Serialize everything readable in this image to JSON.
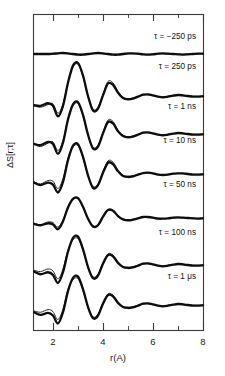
{
  "figure": {
    "axis_label_x": "r(A)",
    "axis_label_y": "ΔS[r;τ]",
    "frame": {
      "left": 33,
      "right": 203,
      "top": 14,
      "bottom": 330
    }
  },
  "chart_data": {
    "type": "line",
    "title": "",
    "xlabel": "r(A)",
    "ylabel": "ΔS[r;τ]",
    "xlim": [
      1.2,
      8.0
    ],
    "ylim": [
      -1.0,
      1.0
    ],
    "grid": false,
    "legend_position": "inline-right",
    "xticks_major": [
      2,
      4,
      6,
      8
    ],
    "xticks_minor": [
      3,
      5,
      7
    ],
    "xtick_labels": [
      "2",
      "4",
      "6",
      "8"
    ],
    "yticks": [],
    "note": "Seven vertically offset radial difference-scattering traces, each an experimental curve overlaid with a model fit, labelled by time delay tau.",
    "series": [
      {
        "name": "τ = −250 ps",
        "label": "τ = −250 ps",
        "baseline_y_px": 54,
        "label_x_px": 196,
        "label_y_px": 32,
        "amplitude": 0.04,
        "x": [
          1.25,
          1.5,
          1.8,
          2.0,
          2.2,
          2.4,
          2.6,
          2.8,
          3.0,
          3.2,
          3.4,
          3.6,
          3.8,
          4.0,
          4.2,
          4.4,
          4.6,
          4.8,
          5.0,
          5.2,
          5.4,
          5.6,
          5.8,
          6.0,
          6.2,
          6.4,
          6.6,
          6.8,
          7.0,
          7.2,
          7.4,
          7.6,
          7.8,
          8.0
        ],
        "values": [
          0.0,
          0.0,
          0.0,
          0.01,
          0.02,
          0.03,
          0.02,
          0.0,
          -0.02,
          -0.02,
          0.0,
          0.02,
          0.03,
          0.02,
          0.0,
          -0.02,
          -0.02,
          0.0,
          0.02,
          0.02,
          0.01,
          -0.01,
          -0.02,
          -0.01,
          0.01,
          0.02,
          0.01,
          0.0,
          -0.01,
          -0.02,
          -0.01,
          0.0,
          0.01,
          0.01
        ],
        "fit": [
          0.0,
          0.0,
          0.0,
          0.0,
          0.01,
          0.02,
          0.01,
          0.0,
          -0.01,
          -0.01,
          0.0,
          0.01,
          0.02,
          0.01,
          0.0,
          -0.01,
          -0.01,
          0.0,
          0.01,
          0.01,
          0.0,
          -0.01,
          -0.01,
          0.0,
          0.01,
          0.01,
          0.0,
          0.0,
          -0.01,
          -0.01,
          0.0,
          0.0,
          0.01,
          0.0
        ]
      },
      {
        "name": "τ = 250 ps",
        "label": "τ = 250 ps",
        "baseline_y_px": 96,
        "label_x_px": 196,
        "label_y_px": 62,
        "amplitude": 1.0,
        "x": [
          1.25,
          1.5,
          1.8,
          2.0,
          2.2,
          2.4,
          2.6,
          2.8,
          3.0,
          3.2,
          3.4,
          3.6,
          3.8,
          4.0,
          4.2,
          4.4,
          4.6,
          4.8,
          5.0,
          5.2,
          5.4,
          5.6,
          5.8,
          6.0,
          6.2,
          6.4,
          6.6,
          6.8,
          7.0,
          7.2,
          7.4,
          7.6,
          7.8,
          8.0
        ],
        "values": [
          -0.28,
          -0.3,
          -0.22,
          -0.3,
          -0.62,
          -0.3,
          0.4,
          0.92,
          1.0,
          0.62,
          0.0,
          -0.44,
          -0.38,
          0.02,
          0.38,
          0.34,
          0.1,
          -0.06,
          -0.1,
          -0.08,
          -0.02,
          0.04,
          0.05,
          0.02,
          -0.02,
          -0.04,
          -0.02,
          0.01,
          0.03,
          0.02,
          0.0,
          -0.02,
          -0.02,
          -0.01
        ],
        "fit": [
          -0.3,
          -0.34,
          -0.26,
          -0.24,
          -0.52,
          -0.24,
          0.42,
          0.88,
          0.96,
          0.58,
          -0.02,
          -0.4,
          -0.34,
          0.06,
          0.44,
          0.4,
          0.14,
          -0.04,
          -0.08,
          -0.06,
          -0.01,
          0.03,
          0.04,
          0.01,
          -0.02,
          -0.03,
          -0.01,
          0.01,
          0.02,
          0.01,
          0.0,
          -0.01,
          -0.01,
          0.0
        ]
      },
      {
        "name": "τ = 1 ns",
        "label": "τ = 1 ns",
        "baseline_y_px": 134,
        "label_x_px": 196,
        "label_y_px": 102,
        "amplitude": 0.95,
        "x": [
          1.25,
          1.5,
          1.8,
          2.0,
          2.2,
          2.4,
          2.6,
          2.8,
          3.0,
          3.2,
          3.4,
          3.6,
          3.8,
          4.0,
          4.2,
          4.4,
          4.6,
          4.8,
          5.0,
          5.2,
          5.4,
          5.6,
          5.8,
          6.0,
          6.2,
          6.4,
          6.6,
          6.8,
          7.0,
          7.2,
          7.4,
          7.6,
          7.8,
          8.0
        ],
        "values": [
          -0.3,
          -0.34,
          -0.24,
          -0.3,
          -0.6,
          -0.26,
          0.44,
          0.9,
          0.96,
          0.58,
          -0.02,
          -0.44,
          -0.38,
          0.02,
          0.36,
          0.32,
          0.08,
          -0.06,
          -0.1,
          -0.08,
          -0.02,
          0.04,
          0.05,
          0.02,
          -0.02,
          -0.04,
          -0.02,
          0.01,
          0.03,
          0.02,
          0.0,
          -0.02,
          -0.02,
          -0.01
        ],
        "fit": [
          -0.32,
          -0.38,
          -0.28,
          -0.24,
          -0.5,
          -0.2,
          0.46,
          0.86,
          0.92,
          0.54,
          -0.04,
          -0.4,
          -0.34,
          0.06,
          0.42,
          0.38,
          0.12,
          -0.04,
          -0.08,
          -0.06,
          -0.01,
          0.03,
          0.04,
          0.01,
          -0.02,
          -0.03,
          -0.01,
          0.01,
          0.02,
          0.01,
          0.0,
          -0.01,
          -0.01,
          0.0
        ]
      },
      {
        "name": "τ = 10 ns",
        "label": "τ = 10 ns",
        "baseline_y_px": 174,
        "label_x_px": 196,
        "label_y_px": 136,
        "amplitude": 0.9,
        "x": [
          1.25,
          1.5,
          1.8,
          2.0,
          2.2,
          2.4,
          2.6,
          2.8,
          3.0,
          3.2,
          3.4,
          3.6,
          3.8,
          4.0,
          4.2,
          4.4,
          4.6,
          4.8,
          5.0,
          5.2,
          5.4,
          5.6,
          5.8,
          6.0,
          6.2,
          6.4,
          6.6,
          6.8,
          7.0,
          7.2,
          7.4,
          7.6,
          7.8,
          8.0
        ],
        "values": [
          -0.26,
          -0.34,
          -0.26,
          -0.32,
          -0.56,
          -0.24,
          0.42,
          0.86,
          0.9,
          0.52,
          -0.04,
          -0.42,
          -0.34,
          0.04,
          0.34,
          0.3,
          0.08,
          -0.06,
          -0.09,
          -0.07,
          -0.02,
          0.03,
          0.04,
          0.02,
          -0.02,
          -0.03,
          -0.02,
          0.01,
          0.02,
          0.02,
          0.0,
          -0.02,
          -0.02,
          -0.01
        ],
        "fit": [
          -0.24,
          -0.3,
          -0.2,
          -0.22,
          -0.44,
          -0.14,
          0.48,
          0.82,
          0.86,
          0.48,
          -0.06,
          -0.38,
          -0.3,
          0.08,
          0.4,
          0.36,
          0.12,
          -0.04,
          -0.07,
          -0.05,
          -0.01,
          0.02,
          0.03,
          0.01,
          -0.01,
          -0.02,
          -0.01,
          0.01,
          0.02,
          0.01,
          0.0,
          -0.01,
          -0.01,
          0.0
        ]
      },
      {
        "name": "τ = 50 ns",
        "label": "τ = 50 ns",
        "baseline_y_px": 218,
        "label_x_px": 196,
        "label_y_px": 180,
        "amplitude": 0.62,
        "x": [
          1.25,
          1.5,
          1.8,
          2.0,
          2.2,
          2.4,
          2.6,
          2.8,
          3.0,
          3.2,
          3.4,
          3.6,
          3.8,
          4.0,
          4.2,
          4.4,
          4.6,
          4.8,
          5.0,
          5.2,
          5.4,
          5.6,
          5.8,
          6.0,
          6.2,
          6.4,
          6.6,
          6.8,
          7.0,
          7.2,
          7.4,
          7.6,
          7.8,
          8.0
        ],
        "values": [
          -0.18,
          -0.22,
          -0.16,
          -0.2,
          -0.34,
          -0.1,
          0.32,
          0.58,
          0.6,
          0.34,
          -0.02,
          -0.26,
          -0.22,
          0.04,
          0.24,
          0.22,
          0.06,
          -0.04,
          -0.07,
          -0.05,
          -0.01,
          0.03,
          0.03,
          0.01,
          -0.02,
          -0.02,
          -0.01,
          0.01,
          0.02,
          0.01,
          0.0,
          -0.01,
          -0.02,
          -0.01
        ],
        "fit": [
          -0.16,
          -0.2,
          -0.12,
          -0.14,
          -0.28,
          -0.06,
          0.34,
          0.56,
          0.58,
          0.32,
          -0.03,
          -0.24,
          -0.2,
          0.06,
          0.26,
          0.24,
          0.08,
          -0.03,
          -0.05,
          -0.04,
          -0.01,
          0.02,
          0.02,
          0.01,
          -0.01,
          -0.02,
          -0.01,
          0.0,
          0.01,
          0.01,
          0.0,
          -0.01,
          -0.01,
          0.0
        ]
      },
      {
        "name": "τ = 100 ns",
        "label": "τ = 100 ns",
        "baseline_y_px": 265,
        "label_x_px": 196,
        "label_y_px": 228,
        "amplitude": 0.85,
        "x": [
          1.25,
          1.5,
          1.8,
          2.0,
          2.2,
          2.4,
          2.6,
          2.8,
          3.0,
          3.2,
          3.4,
          3.6,
          3.8,
          4.0,
          4.2,
          4.4,
          4.6,
          4.8,
          5.0,
          5.2,
          5.4,
          5.6,
          5.8,
          6.0,
          6.2,
          6.4,
          6.6,
          6.8,
          7.0,
          7.2,
          7.4,
          7.6,
          7.8,
          8.0
        ],
        "values": [
          -0.2,
          -0.28,
          -0.22,
          -0.3,
          -0.54,
          -0.22,
          0.4,
          0.82,
          0.86,
          0.48,
          -0.06,
          -0.4,
          -0.32,
          0.04,
          0.3,
          0.26,
          0.06,
          -0.06,
          -0.09,
          -0.07,
          -0.02,
          0.04,
          0.05,
          0.02,
          -0.02,
          -0.04,
          -0.02,
          0.01,
          0.03,
          0.02,
          0.0,
          -0.02,
          -0.02,
          -0.01
        ],
        "fit": [
          -0.16,
          -0.2,
          -0.12,
          -0.18,
          -0.42,
          -0.12,
          0.46,
          0.76,
          0.8,
          0.44,
          -0.08,
          -0.36,
          -0.28,
          0.08,
          0.34,
          0.3,
          0.1,
          -0.04,
          -0.07,
          -0.05,
          -0.01,
          0.03,
          0.04,
          0.01,
          -0.02,
          -0.03,
          -0.01,
          0.01,
          0.02,
          0.01,
          0.0,
          -0.01,
          -0.01,
          0.0
        ]
      },
      {
        "name": "τ = 1 μs",
        "label": "τ = 1 μs",
        "baseline_y_px": 305,
        "label_x_px": 196,
        "label_y_px": 272,
        "amplitude": 0.85,
        "x": [
          1.25,
          1.5,
          1.8,
          2.0,
          2.2,
          2.4,
          2.6,
          2.8,
          3.0,
          3.2,
          3.4,
          3.6,
          3.8,
          4.0,
          4.2,
          4.4,
          4.6,
          4.8,
          5.0,
          5.2,
          5.4,
          5.6,
          5.8,
          6.0,
          6.2,
          6.4,
          6.6,
          6.8,
          7.0,
          7.2,
          7.4,
          7.6,
          7.8,
          8.0
        ],
        "values": [
          -0.22,
          -0.3,
          -0.24,
          -0.32,
          -0.56,
          -0.22,
          0.42,
          0.82,
          0.86,
          0.48,
          -0.06,
          -0.4,
          -0.32,
          0.04,
          0.3,
          0.26,
          0.06,
          -0.06,
          -0.09,
          -0.07,
          -0.02,
          0.04,
          0.05,
          0.02,
          -0.02,
          -0.04,
          -0.02,
          0.01,
          0.03,
          0.02,
          0.0,
          -0.02,
          -0.02,
          -0.01
        ],
        "fit": [
          -0.18,
          -0.22,
          -0.14,
          -0.2,
          -0.44,
          -0.12,
          0.48,
          0.76,
          0.8,
          0.44,
          -0.08,
          -0.36,
          -0.28,
          0.08,
          0.34,
          0.3,
          0.1,
          -0.04,
          -0.07,
          -0.05,
          -0.01,
          0.03,
          0.04,
          0.01,
          -0.02,
          -0.03,
          -0.01,
          0.01,
          0.02,
          0.01,
          0.0,
          -0.01,
          -0.01,
          0.0
        ]
      }
    ]
  }
}
